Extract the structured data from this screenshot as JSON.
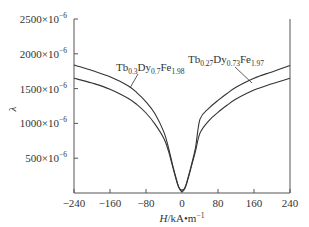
{
  "chart_data": {
    "type": "line",
    "title": "",
    "xlabel": "H/kA•m⁻¹",
    "xlabel_parts": {
      "italic": "H",
      "rest": "/kA•m",
      "sup": "−1"
    },
    "ylabel": "λ",
    "xlim": [
      -240,
      240
    ],
    "ylim": [
      0,
      0.0025
    ],
    "x_ticks": [
      -240,
      -160,
      -80,
      0,
      80,
      160,
      240
    ],
    "x_tick_labels": [
      "−240",
      "−160",
      "−80",
      "0",
      "80",
      "160",
      "240"
    ],
    "y_ticks": [
      0.0005,
      0.001,
      0.0015,
      0.002,
      0.0025
    ],
    "y_tick_labels": [
      {
        "mant": "500×10",
        "exp": "−6"
      },
      {
        "mant": "1000×10",
        "exp": "−6"
      },
      {
        "mant": "1500×10",
        "exp": "−6"
      },
      {
        "mant": "2000×10",
        "exp": "−6"
      },
      {
        "mant": "2500×10",
        "exp": "−6"
      }
    ],
    "grid": false,
    "legend": "inline annotations with leader lines",
    "series": [
      {
        "name": "Tb0.3Dy0.7Fe1.98",
        "label_parts": [
          [
            "Tb",
            ""
          ],
          [
            "0.3",
            "sub"
          ],
          [
            "Dy",
            ""
          ],
          [
            "0.7",
            "sub"
          ],
          [
            "Fe",
            ""
          ],
          [
            "1.98",
            "sub"
          ]
        ],
        "x": [
          -240,
          -200,
          -160,
          -120,
          -100,
          -80,
          -60,
          -40,
          -30,
          -20,
          -10,
          -5,
          0,
          5,
          10,
          20,
          30,
          40,
          60,
          80,
          100,
          120,
          160,
          200,
          240
        ],
        "y_ppm": [
          1840,
          1760,
          1670,
          1540,
          1440,
          1310,
          1140,
          870,
          650,
          380,
          140,
          60,
          40,
          60,
          140,
          380,
          650,
          1060,
          1220,
          1330,
          1430,
          1520,
          1650,
          1740,
          1830
        ]
      },
      {
        "name": "Tb0.27Dy0.73Fe1.97",
        "label_parts": [
          [
            "Tb",
            ""
          ],
          [
            "0.27",
            "sub"
          ],
          [
            "Dy",
            ""
          ],
          [
            "0.73",
            "sub"
          ],
          [
            "Fe",
            ""
          ],
          [
            "1.97",
            "sub"
          ]
        ],
        "x": [
          -240,
          -200,
          -160,
          -120,
          -100,
          -80,
          -60,
          -40,
          -30,
          -20,
          -10,
          -5,
          0,
          5,
          10,
          20,
          30,
          40,
          60,
          80,
          100,
          120,
          160,
          200,
          240
        ],
        "y_ppm": [
          1650,
          1580,
          1490,
          1360,
          1270,
          1150,
          990,
          780,
          600,
          360,
          130,
          50,
          20,
          50,
          130,
          360,
          600,
          860,
          1040,
          1160,
          1260,
          1350,
          1480,
          1570,
          1650
        ]
      }
    ]
  }
}
